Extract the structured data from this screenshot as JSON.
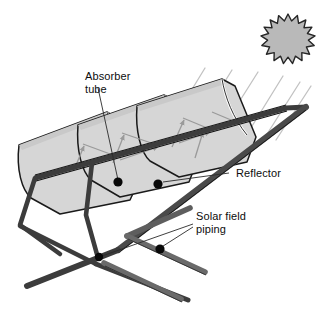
{
  "diagram": {
    "type": "technical-illustration",
    "background_color": "#ffffff"
  },
  "labels": {
    "absorber_tube_line1": "Absorber",
    "absorber_tube_line2": "tube",
    "reflector": "Reflector",
    "solar_field_piping_line1": "Solar field",
    "solar_field_piping_line2": "piping"
  },
  "icons": {
    "sun": "sun-icon",
    "absorber_callout_dot": "callout-dot-icon",
    "reflector_callout_dot": "callout-dot-icon",
    "piping_callout_dot_left": "callout-dot-icon",
    "piping_callout_dot_right": "callout-dot-icon"
  },
  "colors": {
    "outline": "#1a1a1a",
    "reflector_fill": "#d6d6d6",
    "reflector_fill_shaded": "#c9c9c9",
    "rib_highlight": "#ffffff",
    "frame_rail_dark": "#3c3c3c",
    "frame_rail_mid": "#5a5a5a",
    "piping_gray": "#5e5e5e",
    "piping_light": "#8c8c8c",
    "sun_fill": "#b9b9b9",
    "sun_outline": "#262626",
    "sun_ray": "#c2c2c2",
    "reflected_ray": "#9a9a9a",
    "leader_line": "#2a2a2a",
    "text": "#0d0d0d"
  },
  "elements": {
    "collector_modules": 3,
    "support_legs": 2,
    "piping_runs": 2,
    "sun_ray_count": 5,
    "sun_points": 19
  }
}
